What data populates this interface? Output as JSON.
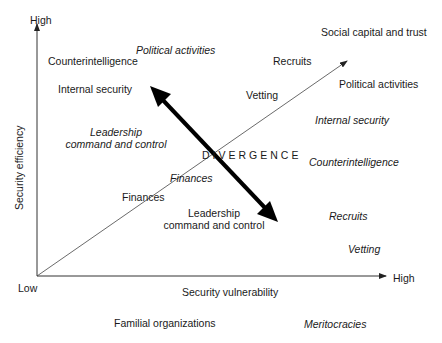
{
  "axes": {
    "y_high": "High",
    "y_label": "Security efficiency",
    "origin_low": "Low",
    "x_high": "High",
    "x_label": "Security vulnerability"
  },
  "divergence_label": "DIVERGENCE",
  "diagonal_label": "Social capital and trust",
  "familial": {
    "title": "Familial organizations",
    "items": [
      "Counterintelligence",
      "Internal security",
      "Vetting",
      "Recruits",
      "Finances",
      "Leadership command and control"
    ]
  },
  "meritocracies": {
    "title": "Meritocracies",
    "items": [
      "Political activities",
      "Leadership command and control",
      "Finances",
      "Internal security",
      "Counterintelligence",
      "Recruits",
      "Vetting"
    ]
  },
  "labels": {
    "counterintelligence_upright": "Counterintelligence",
    "political_italic_top": "Political activities",
    "internal_security_upright": "Internal security",
    "leadership_italic_1": "Leadership",
    "leadership_italic_2": "command and control",
    "finances_upright": "Finances",
    "finances_italic": "Finances",
    "leadership_upright_1": "Leadership",
    "leadership_upright_2": "command and control",
    "recruits_upright": "Recruits",
    "vetting_upright": "Vetting",
    "political_upright_right": "Political activities",
    "internal_security_italic": "Internal security",
    "counterintelligence_italic": "Counterintelligence",
    "recruits_italic": "Recruits",
    "vetting_italic": "Vetting"
  }
}
